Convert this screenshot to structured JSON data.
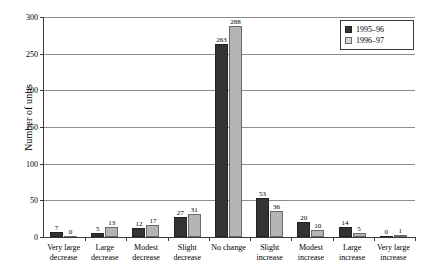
{
  "chart_data": {
    "type": "bar",
    "title": "",
    "xlabel": "",
    "ylabel": "Number of units",
    "ylim": [
      0,
      300
    ],
    "yticks": [
      0,
      50,
      100,
      150,
      200,
      250,
      300
    ],
    "grid": true,
    "legend_position": "top-right",
    "categories": [
      "Very large decrease",
      "Large decrease",
      "Modest decrease",
      "Slight decrease",
      "No change",
      "Slight increase",
      "Modest increase",
      "Large increase",
      "Very large increase"
    ],
    "category_lines": [
      [
        "Very large",
        "decrease"
      ],
      [
        "Large",
        "decrease"
      ],
      [
        "Modest",
        "decrease"
      ],
      [
        "Slight",
        "decrease"
      ],
      [
        "No change"
      ],
      [
        "Slight",
        "increase"
      ],
      [
        "Modest",
        "increase"
      ],
      [
        "Large",
        "increase"
      ],
      [
        "Very large",
        "increase"
      ]
    ],
    "series": [
      {
        "name": "1995–96",
        "color": "#333333",
        "values": [
          7,
          5,
          12,
          27,
          263,
          53,
          20,
          14,
          0
        ]
      },
      {
        "name": "1996–97",
        "color": "#b4b4b4",
        "values": [
          0,
          13,
          17,
          31,
          288,
          36,
          10,
          5,
          1
        ]
      }
    ]
  },
  "legend": {
    "items": [
      {
        "label": "1995–96"
      },
      {
        "label": "1996–97"
      }
    ]
  }
}
